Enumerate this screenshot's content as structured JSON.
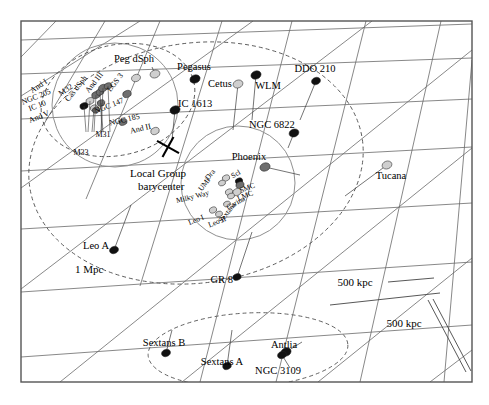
{
  "figure": {
    "type": "diagram",
    "frame": {
      "x": 21,
      "y": 21,
      "width": 451,
      "height": 361,
      "stroke": "#555555",
      "fill": "#ffffff"
    }
  },
  "colors": {
    "grid": "#6a6a6a",
    "frame": "#555555",
    "dashed": "#555555",
    "circle": "#909090",
    "dark_marker": "#111111",
    "mid_marker": "#6f6f6f",
    "light_marker": "#cfcfcf",
    "leader": "#3a3a3a",
    "text": "#000000"
  },
  "scale_bars": [
    {
      "label": "500 kpc",
      "x": 355,
      "y": 286,
      "bar": "horizontal"
    },
    {
      "label": "500 kpc",
      "x": 404,
      "y": 327,
      "bar": "diagonal"
    }
  ],
  "contours": [
    {
      "name": "1 Mpc",
      "label": "1 Mpc",
      "x": 75,
      "y": 273,
      "style": "dashed-ellipse"
    }
  ],
  "annotations": [
    {
      "name": "local-group-barycenter",
      "label_line_1": "Local Group",
      "label_line_2": "barycenter",
      "x": 130,
      "y": 177,
      "marker": {
        "type": "cross-x",
        "x": 168,
        "y": 147,
        "size": 11
      }
    }
  ],
  "subgroups": [
    {
      "name": "m31-subgroup-circle",
      "cx": 115,
      "cy": 105,
      "rx": 63,
      "ry": 62
    },
    {
      "name": "milky-way-subgroup-circle",
      "cx": 238,
      "cy": 183,
      "rx": 57,
      "ry": 57
    },
    {
      "name": "m31-halo-dashed",
      "cx": 118,
      "cy": 100,
      "rx": 78,
      "ry": 55,
      "rot": -14
    },
    {
      "name": "local-group-dashed",
      "cx": 196,
      "cy": 163,
      "rx": 168,
      "ry": 120,
      "rot": -8
    },
    {
      "name": "sextans-ngc3109-dashed",
      "cx": 248,
      "cy": 350,
      "rx": 100,
      "ry": 37,
      "rot": -3
    }
  ],
  "galaxies": [
    {
      "name": "peg-dsph",
      "label": "Peg dSph",
      "mx": 155,
      "my": 74,
      "r": 5.0,
      "tone": "light",
      "lx": 134,
      "ly": 62,
      "anchor": "middle",
      "rot": 0,
      "lead": [
        155,
        74,
        152,
        67
      ]
    },
    {
      "name": "pegasus",
      "label": "Pegasus",
      "mx": 195,
      "my": 79,
      "r": 5.2,
      "tone": "dark",
      "lx": 194,
      "ly": 70,
      "anchor": "middle",
      "rot": 0,
      "lead": [
        195,
        79,
        190,
        82
      ]
    },
    {
      "name": "cetus",
      "label": "Cetus",
      "mx": 238,
      "my": 84,
      "r": 5.0,
      "tone": "light",
      "lx": 220,
      "ly": 87,
      "anchor": "middle",
      "rot": 0,
      "lead": [
        238,
        84,
        233,
        130
      ]
    },
    {
      "name": "wlm",
      "label": "WLM",
      "mx": 256,
      "my": 75,
      "r": 5.2,
      "tone": "dark",
      "lx": 268,
      "ly": 89,
      "anchor": "middle",
      "rot": 0,
      "lead": [
        256,
        75,
        252,
        120
      ]
    },
    {
      "name": "ddo-210",
      "label": "DDO 210",
      "mx": 316,
      "my": 81,
      "r": 4.6,
      "tone": "dark",
      "lx": 315,
      "ly": 72,
      "anchor": "middle",
      "rot": 0,
      "lead": [
        316,
        81,
        300,
        120
      ]
    },
    {
      "name": "ic-1613",
      "label": "IC 1613",
      "mx": 175,
      "my": 110,
      "r": 5.2,
      "tone": "dark",
      "lx": 178,
      "ly": 107,
      "anchor": "start",
      "rot": 0,
      "lead": [
        175,
        110,
        172,
        140
      ]
    },
    {
      "name": "ngc-6822",
      "label": "NGC 6822",
      "mx": 294,
      "my": 133,
      "r": 5.0,
      "tone": "dark",
      "lx": 249,
      "ly": 128,
      "anchor": "start",
      "rot": 0,
      "lead": [
        294,
        133,
        288,
        148
      ]
    },
    {
      "name": "phoenix",
      "label": "Phoenix",
      "mx": 265,
      "my": 167,
      "r": 5.2,
      "tone": "mid",
      "lx": 249,
      "ly": 160,
      "anchor": "middle",
      "rot": 0,
      "lead": [
        265,
        167,
        300,
        175
      ]
    },
    {
      "name": "tucana",
      "label": "Tucana",
      "mx": 387,
      "my": 165,
      "r": 5.0,
      "tone": "light",
      "lx": 391,
      "ly": 179,
      "anchor": "middle",
      "rot": 0,
      "lead": [
        387,
        165,
        345,
        196
      ]
    },
    {
      "name": "leo-a",
      "label": "Leo A",
      "mx": 114,
      "my": 250,
      "r": 4.6,
      "tone": "dark",
      "lx": 109,
      "ly": 249,
      "anchor": "end",
      "rot": 0,
      "lead": [
        114,
        250,
        131,
        205
      ]
    },
    {
      "name": "gr-8",
      "label": "GR 8",
      "mx": 237,
      "my": 277,
      "r": 4.2,
      "tone": "dark",
      "lx": 233,
      "ly": 283,
      "anchor": "end",
      "rot": 0,
      "lead": [
        237,
        277,
        252,
        232
      ]
    },
    {
      "name": "sextans-b",
      "label": "Sextans B",
      "mx": 166,
      "my": 353,
      "r": 4.6,
      "tone": "dark",
      "lx": 164,
      "ly": 346,
      "anchor": "middle",
      "rot": 0,
      "lead": [
        166,
        353,
        172,
        330
      ]
    },
    {
      "name": "sextans-a",
      "label": "Sextans A",
      "mx": 227,
      "my": 366,
      "r": 4.4,
      "tone": "dark",
      "lx": 222,
      "ly": 365,
      "anchor": "middle",
      "rot": 0,
      "lead": [
        227,
        366,
        232,
        330
      ]
    },
    {
      "name": "antlia",
      "label": "Antlia",
      "mx": 286,
      "my": 352,
      "r": 5.2,
      "tone": "dark",
      "lx": 284,
      "ly": 348,
      "anchor": "middle",
      "rot": 0,
      "lead": [
        286,
        352,
        302,
        342
      ]
    },
    {
      "name": "ngc-3109",
      "label": "NGC 3109",
      "mx": 282,
      "my": 355,
      "r": 4.6,
      "tone": "dark",
      "lx": 278,
      "ly": 374,
      "anchor": "middle",
      "rot": 0,
      "lead": [
        282,
        355,
        290,
        368
      ]
    }
  ],
  "m31_group": [
    {
      "name": "and-i",
      "label": "And I",
      "mx": 96,
      "my": 95,
      "r": 4.4,
      "tone": "mid",
      "lx": 40,
      "ly": 88,
      "rot": -34
    },
    {
      "name": "m32",
      "label": "M32",
      "mx": 100,
      "my": 92,
      "r": 4.0,
      "tone": "mid",
      "lx": 67,
      "ly": 92,
      "rot": -34
    },
    {
      "name": "cas-dsph",
      "label": "Cas dSph",
      "mx": 103,
      "my": 88,
      "r": 4.6,
      "tone": "mid",
      "lx": 78,
      "ly": 90,
      "rot": -52
    },
    {
      "name": "and-iii",
      "label": "And III",
      "mx": 108,
      "my": 86,
      "r": 4.0,
      "tone": "mid",
      "lx": 96,
      "ly": 84,
      "rot": -52
    },
    {
      "name": "lgs-3",
      "label": "LGS 3",
      "mx": 136,
      "my": 78,
      "r": 4.6,
      "tone": "light",
      "lx": 117,
      "ly": 84,
      "rot": -52
    },
    {
      "name": "ngc-205",
      "label": "NGC 205",
      "mx": 90,
      "my": 101,
      "r": 4.2,
      "tone": "light",
      "lx": 37,
      "ly": 99,
      "rot": -22
    },
    {
      "name": "ic-10",
      "label": "IC 10",
      "mx": 84,
      "my": 106,
      "r": 4.2,
      "tone": "dark",
      "lx": 38,
      "ly": 108,
      "rot": -22
    },
    {
      "name": "and-v",
      "label": "And V",
      "mx": 94,
      "my": 108,
      "r": 3.8,
      "tone": "light",
      "lx": 40,
      "ly": 119,
      "rot": -22
    },
    {
      "name": "ngc-147",
      "label": "NGC 147",
      "mx": 127,
      "my": 94,
      "r": 4.4,
      "tone": "mid",
      "lx": 110,
      "ly": 108,
      "rot": -22
    },
    {
      "name": "ngc-185",
      "label": "NGC 185",
      "mx": 123,
      "my": 122,
      "r": 4.2,
      "tone": "mid",
      "lx": 125,
      "ly": 122,
      "rot": -13
    },
    {
      "name": "and-ii",
      "label": "And II",
      "mx": 155,
      "my": 131,
      "r": 4.4,
      "tone": "light",
      "lx": 141,
      "ly": 131,
      "rot": -13
    },
    {
      "name": "m31",
      "label": "M31",
      "mx": 101,
      "my": 103,
      "r": 4.0,
      "tone": "mid",
      "lx": 103,
      "ly": 137,
      "rot": 0
    },
    {
      "name": "m33",
      "label": "M33",
      "mx": 96,
      "my": 110,
      "r": 3.8,
      "tone": "mid",
      "lx": 81,
      "ly": 155,
      "rot": 0
    }
  ],
  "mw_group": [
    {
      "name": "draco",
      "label": "Dra",
      "mx": 226,
      "my": 178,
      "r": 3.8,
      "tone": "light",
      "lx": 212,
      "ly": 176,
      "rot": -52
    },
    {
      "name": "umi",
      "label": "UMi",
      "mx": 222,
      "my": 183,
      "r": 3.6,
      "tone": "light",
      "lx": 206,
      "ly": 186,
      "rot": -52
    },
    {
      "name": "sculptor",
      "label": "Scl",
      "mx": 239,
      "my": 181,
      "r": 3.8,
      "tone": "dark",
      "lx": 237,
      "ly": 176,
      "rot": -30
    },
    {
      "name": "smc",
      "label": "SMC",
      "mx": 240,
      "my": 185,
      "r": 4.2,
      "tone": "mid",
      "lx": 248,
      "ly": 190,
      "rot": -22
    },
    {
      "name": "lmc",
      "label": "LMC",
      "mx": 237,
      "my": 192,
      "r": 4.4,
      "tone": "light",
      "lx": 246,
      "ly": 198,
      "rot": -22
    },
    {
      "name": "milky-way",
      "label": "Milky Way",
      "mx": 229,
      "my": 192,
      "r": 3.8,
      "tone": "light",
      "lx": 193,
      "ly": 199,
      "rot": -14
    },
    {
      "name": "carina",
      "label": "Carina",
      "mx": 231,
      "my": 196,
      "r": 3.6,
      "tone": "light",
      "lx": 237,
      "ly": 205,
      "rot": -30
    },
    {
      "name": "sextans",
      "label": "Sextans",
      "mx": 227,
      "my": 204,
      "r": 3.6,
      "tone": "light",
      "lx": 229,
      "ly": 214,
      "rot": -52
    },
    {
      "name": "leo-i",
      "label": "Leo I",
      "mx": 213,
      "my": 210,
      "r": 3.8,
      "tone": "light",
      "lx": 197,
      "ly": 222,
      "rot": -22
    },
    {
      "name": "leo-ii",
      "label": "Leo II",
      "mx": 219,
      "my": 214,
      "r": 3.6,
      "tone": "light",
      "lx": 218,
      "ly": 224,
      "rot": -22
    }
  ],
  "grid_lines": {
    "family_a": [
      [
        21,
        40,
        472,
        24
      ],
      [
        21,
        74,
        472,
        58
      ],
      [
        21,
        119,
        472,
        99
      ],
      [
        21,
        171,
        472,
        147
      ],
      [
        21,
        229,
        472,
        203
      ],
      [
        21,
        292,
        472,
        262
      ],
      [
        21,
        357,
        472,
        325
      ]
    ],
    "family_b": [
      [
        56,
        21,
        21,
        57
      ],
      [
        105,
        21,
        44,
        124
      ],
      [
        160,
        21,
        86,
        199
      ],
      [
        222,
        21,
        140,
        286
      ],
      [
        292,
        21,
        200,
        382
      ],
      [
        366,
        21,
        276,
        382
      ],
      [
        441,
        21,
        360,
        382
      ],
      [
        472,
        60,
        444,
        382
      ]
    ],
    "family_c": [
      [
        21,
        96,
        140,
        21
      ],
      [
        21,
        188,
        253,
        21
      ],
      [
        21,
        289,
        372,
        21
      ],
      [
        60,
        382,
        472,
        50
      ],
      [
        182,
        382,
        472,
        148
      ],
      [
        318,
        382,
        472,
        258
      ],
      [
        430,
        382,
        472,
        350
      ]
    ]
  }
}
